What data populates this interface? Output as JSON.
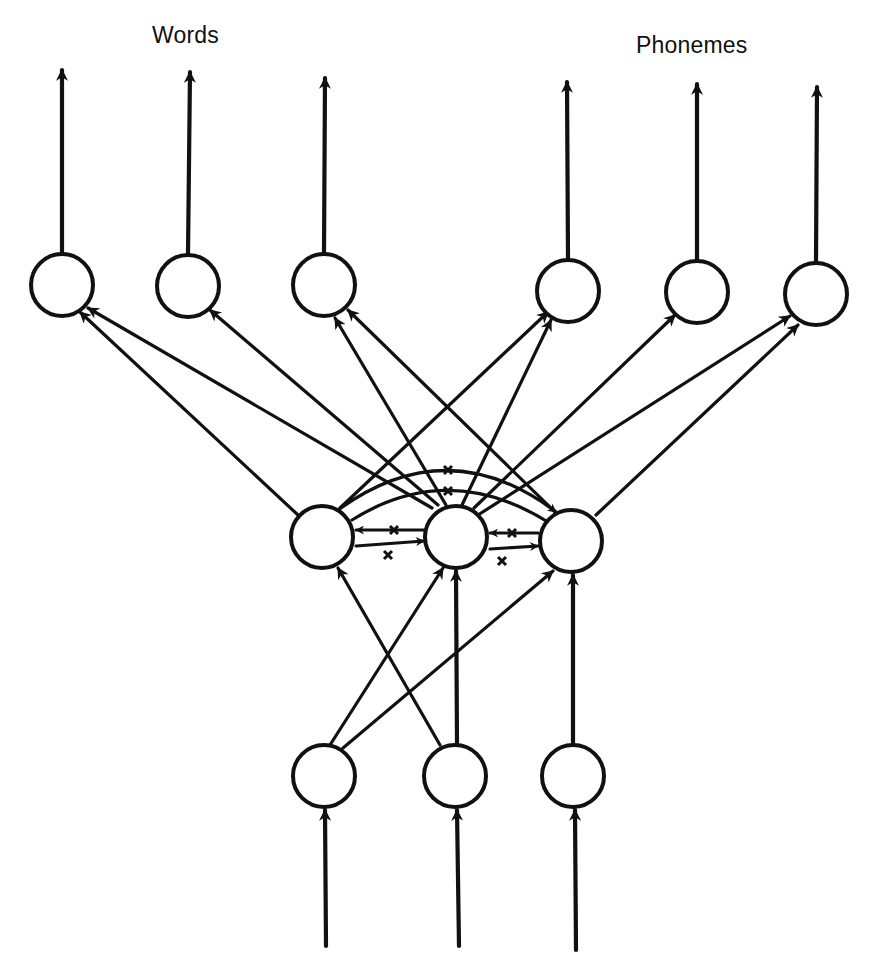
{
  "labels": {
    "words": "Words",
    "phonemes": "Phonemes"
  },
  "diagram": {
    "type": "interactive-activation network",
    "layers": {
      "output": {
        "nodes": [
          {
            "id": "o1",
            "group": "Words",
            "cx": 62,
            "cy": 285
          },
          {
            "id": "o2",
            "group": "Words",
            "cx": 188,
            "cy": 286
          },
          {
            "id": "o3",
            "group": "Words",
            "cx": 324,
            "cy": 285
          },
          {
            "id": "o4",
            "group": "Phonemes",
            "cx": 568,
            "cy": 291
          },
          {
            "id": "o5",
            "group": "Phonemes",
            "cx": 697,
            "cy": 292
          },
          {
            "id": "o6",
            "group": "Phonemes",
            "cx": 816,
            "cy": 294
          }
        ],
        "output_arrow_tip_y": [
          68,
          70,
          76,
          80,
          82,
          85
        ]
      },
      "hidden": {
        "nodes": [
          {
            "id": "h1",
            "cx": 322,
            "cy": 537
          },
          {
            "id": "h2",
            "cx": 456,
            "cy": 537
          },
          {
            "id": "h3",
            "cx": 571,
            "cy": 541
          }
        ],
        "lateral_connections": "inhibitory (marked with x), mutual between every pair"
      },
      "input": {
        "nodes": [
          {
            "id": "i1",
            "cx": 324,
            "cy": 776
          },
          {
            "id": "i2",
            "cx": 455,
            "cy": 776
          },
          {
            "id": "i3",
            "cx": 573,
            "cy": 776
          }
        ],
        "input_line_bottom_y": 946
      }
    },
    "edges_input_to_hidden": [
      {
        "from": "i1",
        "to": "h2"
      },
      {
        "from": "i1",
        "to": "h3"
      },
      {
        "from": "i2",
        "to": "h1"
      },
      {
        "from": "i2",
        "to": "h2"
      },
      {
        "from": "i3",
        "to": "h3"
      }
    ],
    "edges_hidden_to_output": [
      {
        "from": "h1",
        "to": "o1"
      },
      {
        "from": "h1",
        "to": "o4"
      },
      {
        "from": "h1",
        "to": "o6"
      },
      {
        "from": "h2",
        "to": "o1"
      },
      {
        "from": "h2",
        "to": "o2"
      },
      {
        "from": "h2",
        "to": "o3"
      },
      {
        "from": "h2",
        "to": "o4"
      },
      {
        "from": "h2",
        "to": "o5"
      },
      {
        "from": "h3",
        "to": "o3"
      },
      {
        "from": "h3",
        "to": "o6"
      },
      {
        "from": "h1",
        "to": "o5"
      }
    ],
    "node_radius": 32,
    "stroke_color": "#111111",
    "background_color": "#ffffff"
  }
}
